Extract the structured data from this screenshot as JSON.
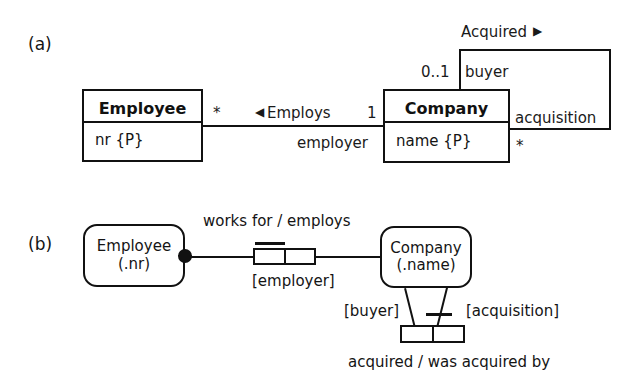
{
  "figure": {
    "part_a_tag": "(a)",
    "part_b_tag": "(b)"
  },
  "uml": {
    "employee": {
      "name": "Employee",
      "attribute": "nr {P}"
    },
    "company": {
      "name": "Company",
      "attribute": "name {P}"
    },
    "employs_association": {
      "name": "Employs",
      "direction_arrow": "◀",
      "employee_multiplicity": "*",
      "company_multiplicity": "1",
      "company_role": "employer"
    },
    "acquired_association": {
      "name": "Acquired",
      "direction_arrow": "▶",
      "buyer_multiplicity": "0..1",
      "buyer_role": "buyer",
      "acquisition_role": "acquisition",
      "acquisition_multiplicity": "*"
    }
  },
  "orm": {
    "employee_entity": {
      "line1": "Employee",
      "line2": "(.nr)"
    },
    "company_entity": {
      "line1": "Company",
      "line2": "(.name)"
    },
    "works_for_fact": {
      "predicate_reading": "works for / employs",
      "role_name": "[employer]"
    },
    "acquired_fact": {
      "predicate_reading": "acquired / was acquired by",
      "buyer_role": "[buyer]",
      "acquisition_role": "[acquisition]"
    }
  }
}
